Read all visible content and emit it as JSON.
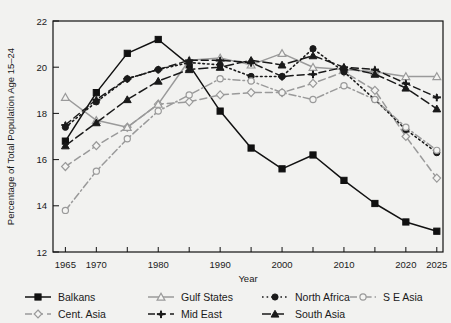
{
  "chart_data": {
    "type": "line",
    "title": "",
    "xlabel": "Year",
    "ylabel": "Percentage of Total Population Age 15–24",
    "xlim": [
      1963,
      2026
    ],
    "ylim": [
      12,
      22
    ],
    "yticks": [
      12,
      14,
      16,
      18,
      20,
      22
    ],
    "xticks": [
      1965,
      1970,
      1980,
      1990,
      2000,
      2010,
      2020,
      2025
    ],
    "xtick_labels": [
      "1965",
      "1970",
      "1980",
      "1990",
      "2000",
      "2010",
      "2020",
      "2025"
    ],
    "ytick_labels": [
      "12",
      "14",
      "16",
      "18",
      "20",
      "22"
    ],
    "minor_xticks": [
      1965,
      1970,
      1975,
      1980,
      1985,
      1990,
      1995,
      2000,
      2005,
      2010,
      2015,
      2020,
      2025
    ],
    "grid": false,
    "legend_position": "below",
    "x": [
      1965,
      1970,
      1975,
      1980,
      1985,
      1990,
      1995,
      2000,
      2005,
      2010,
      2015,
      2020,
      2025
    ],
    "series": [
      {
        "name": "Balkans",
        "color": "#111111",
        "dash": "solid",
        "marker": "square-filled",
        "values": [
          16.8,
          18.9,
          20.6,
          21.2,
          20.1,
          18.1,
          16.5,
          15.6,
          16.2,
          15.1,
          14.1,
          13.3,
          12.9
        ]
      },
      {
        "name": "Cent. Asia",
        "color": "#9a9a9a",
        "dash": "dashed",
        "marker": "diamond-open",
        "values": [
          15.7,
          16.6,
          17.4,
          18.4,
          18.5,
          18.8,
          18.9,
          18.9,
          19.3,
          19.8,
          19.0,
          17.0,
          15.2
        ]
      },
      {
        "name": "Gulf States",
        "color": "#9a9a9a",
        "dash": "solid",
        "marker": "triangle-open",
        "values": [
          18.7,
          17.7,
          17.4,
          18.4,
          20.3,
          20.4,
          20.1,
          20.6,
          20.0,
          19.9,
          19.8,
          19.6,
          19.6
        ]
      },
      {
        "name": "Mid East",
        "color": "#1a1a1a",
        "dash": "dashed",
        "marker": "plus-filled",
        "values": [
          17.5,
          18.6,
          19.5,
          19.9,
          20.3,
          20.3,
          20.2,
          19.6,
          19.7,
          20.0,
          19.9,
          19.3,
          18.7
        ]
      },
      {
        "name": "North Africa",
        "color": "#1a1a1a",
        "dash": "dotted",
        "marker": "circle-filled",
        "values": [
          17.4,
          18.5,
          19.5,
          19.9,
          20.2,
          20.1,
          19.6,
          19.6,
          20.8,
          19.8,
          18.6,
          17.3,
          16.3
        ]
      },
      {
        "name": "S E Asia",
        "color": "#9a9a9a",
        "dash": "dashdot",
        "marker": "circle-open",
        "values": [
          13.8,
          15.5,
          16.9,
          18.1,
          18.8,
          19.5,
          19.4,
          18.9,
          18.6,
          19.2,
          18.6,
          17.4,
          16.4
        ]
      },
      {
        "name": "South Asia",
        "color": "#1a1a1a",
        "dash": "longdash",
        "marker": "triangle-filled",
        "values": [
          16.6,
          17.6,
          18.6,
          19.4,
          19.9,
          20.0,
          20.3,
          20.1,
          20.5,
          20.0,
          19.7,
          19.1,
          18.2
        ]
      }
    ]
  },
  "legend": {
    "entries": [
      {
        "label": "Balkans"
      },
      {
        "label": "Gulf States"
      },
      {
        "label": "North Africa"
      },
      {
        "label": "S E Asia"
      },
      {
        "label": "Cent. Asia"
      },
      {
        "label": "Mid East"
      },
      {
        "label": "South Asia"
      }
    ]
  },
  "axes": {
    "y_title": "Percentage of Total Population Age 15−24",
    "x_title": "Year"
  }
}
